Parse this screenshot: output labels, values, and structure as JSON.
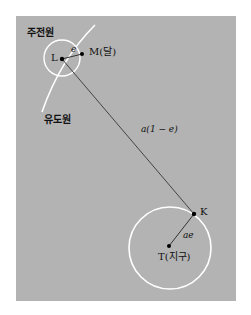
{
  "diagram": {
    "labels": {
      "perigee_circle": "주전원",
      "deferent_circle": "유도원",
      "point_L": "L",
      "point_M": "M(달)",
      "small_radius": "e",
      "distance_LK": "a(1 − e)",
      "point_K": "K",
      "large_radius": "ae",
      "point_T": "T(지구)"
    },
    "colors": {
      "background": "#b3b3b3",
      "circle": "#ffffff",
      "line": "#333333",
      "point": "#000000"
    }
  }
}
